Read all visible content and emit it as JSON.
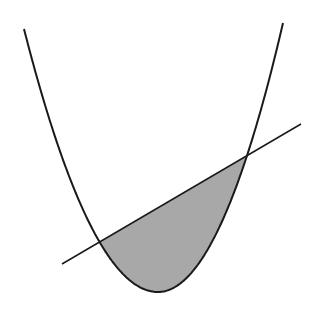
{
  "diagram": {
    "colors": {
      "background": "#ffffff",
      "stroke": "#1a1a1a",
      "fill": "#a8a8a8"
    },
    "parabola": {
      "left_top": [
        24,
        29
      ],
      "vertex": [
        158,
        292
      ],
      "right_top": [
        283,
        23
      ]
    },
    "line": {
      "start": [
        62,
        264
      ],
      "end": [
        301,
        124
      ]
    },
    "intersections": [
      [
        101,
        240
      ],
      [
        246,
        156
      ]
    ]
  }
}
